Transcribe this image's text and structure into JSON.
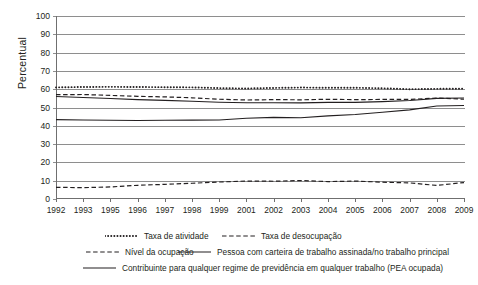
{
  "chart_data": {
    "type": "line",
    "title": "",
    "xlabel": "",
    "ylabel": "Percentual",
    "ylim": [
      0,
      100
    ],
    "ytick_step": 10,
    "yticks": [
      0,
      10,
      20,
      30,
      40,
      50,
      60,
      70,
      80,
      90,
      100
    ],
    "grid": true,
    "legend_position": "bottom",
    "categories": [
      "1992",
      "1993",
      "1995",
      "1996",
      "1997",
      "1998",
      "1999",
      "2001",
      "2002",
      "2003",
      "2004",
      "2005",
      "2006",
      "2007",
      "2008",
      "2009"
    ],
    "series": [
      {
        "name": "Taxa de atividade",
        "style": "dotted",
        "values": [
          61.0,
          61.2,
          61.3,
          61.2,
          61.1,
          61.0,
          60.6,
          60.4,
          60.7,
          60.9,
          60.8,
          60.8,
          60.5,
          60.0,
          60.2,
          60.3
        ]
      },
      {
        "name": "Taxa de desocupação",
        "style": "dashed",
        "values": [
          6.4,
          6.2,
          6.6,
          7.5,
          8.0,
          8.6,
          9.3,
          9.8,
          9.7,
          10.1,
          9.5,
          9.8,
          9.2,
          8.8,
          7.4,
          9.0
        ]
      },
      {
        "name": "Nível da ocupação",
        "style": "dashed",
        "values": [
          57.0,
          57.1,
          56.6,
          56.1,
          55.8,
          55.3,
          54.5,
          54.1,
          54.3,
          54.2,
          54.5,
          54.3,
          54.4,
          54.4,
          55.2,
          54.5
        ]
      },
      {
        "name": "Pessoa com carteira de trabalho assinada/no trabalho principal",
        "style": "solid",
        "values": [
          56.0,
          55.5,
          54.9,
          54.3,
          53.9,
          53.4,
          52.9,
          52.6,
          52.6,
          52.5,
          52.8,
          52.8,
          53.2,
          53.8,
          55.0,
          55.2
        ]
      },
      {
        "name": "Contribuinte para qualquer regime de previdência em qualquer trabalho (PEA ocupada)",
        "style": "solid",
        "values": [
          43.4,
          43.2,
          43.0,
          42.9,
          43.0,
          43.1,
          43.2,
          44.1,
          44.6,
          44.4,
          45.4,
          46.2,
          47.4,
          48.7,
          50.8,
          51.1
        ]
      }
    ]
  },
  "axis": {
    "y_title": "Percentual"
  },
  "legend": {
    "rows": [
      [
        {
          "label": "Taxa de atividade",
          "style": "dotted"
        },
        {
          "label": "Taxa de desocupação",
          "style": "dashed"
        }
      ],
      [
        {
          "label": "Nível da ocupação",
          "style": "dashed"
        },
        {
          "label": "Pessoa com carteira de trabalho assinada/no trabalho principal",
          "style": "solid"
        }
      ],
      [
        {
          "label": "Contribuinte para qualquer regime de previdência em qualquer trabalho (PEA ocupada)",
          "style": "solid"
        }
      ]
    ]
  }
}
